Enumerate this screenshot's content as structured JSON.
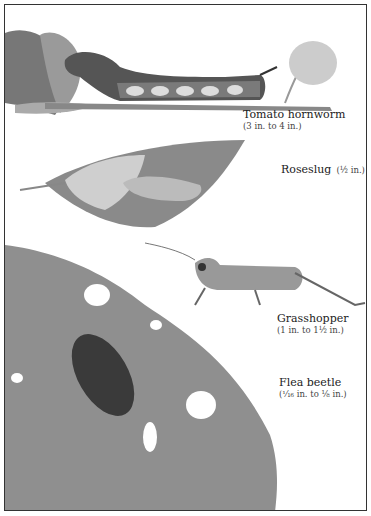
{
  "illustration": {
    "specimens": [
      {
        "name": "Tomato hornworm",
        "size": "(3 in. to 4 in.)"
      },
      {
        "name": "Roseslug",
        "size": "(½ in.)"
      },
      {
        "name": "Grasshopper",
        "size": "(1 in. to 1½ in.)"
      },
      {
        "name": "Flea beetle",
        "size": "(¹⁄₁₆ in. to ⅛ in.)"
      }
    ],
    "colors": {
      "frame": "#333333",
      "leaf_dark": "#6e6e6e",
      "leaf_mid": "#9a9a9a",
      "leaf_light": "#c8c8c8"
    }
  }
}
